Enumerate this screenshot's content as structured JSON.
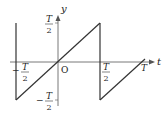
{
  "diagram": {
    "type": "sawtooth-graph",
    "axes": {
      "x_label": "t",
      "y_label": "y",
      "origin_label": "O"
    },
    "ticks": {
      "y_top": {
        "num": "T",
        "den": "2"
      },
      "y_bottom": {
        "sign": "−",
        "num": "T",
        "den": "2"
      },
      "x_left": {
        "sign": "−",
        "num": "T",
        "den": "2"
      },
      "x_right": {
        "num": "T",
        "den": "2"
      },
      "x_end": "T"
    },
    "colors": {
      "line": "#333333",
      "axis": "#555555"
    }
  }
}
